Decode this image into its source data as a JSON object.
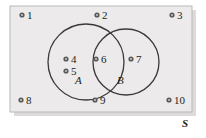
{
  "diagram": {
    "type": "venn-two-set",
    "universe_label": "S",
    "universe_rect": {
      "x": 10,
      "y": 6,
      "width": 182,
      "height": 106,
      "fill": "#eceaea",
      "stroke": "#bdbdbd"
    },
    "shadow_color": "#d8d6d6",
    "stroke_color": "#3a3a3a",
    "dot_color": "#5a5a5a",
    "text_color": "#231f20",
    "sets": [
      {
        "name": "A",
        "label": "A",
        "label_x": 75,
        "label_y": 75,
        "cx": 86,
        "cy": 62,
        "r": 38
      },
      {
        "name": "B",
        "label": "B",
        "label_x": 117,
        "label_y": 75,
        "cx": 126,
        "cy": 62,
        "r": 33
      }
    ],
    "elements": [
      {
        "label": "1",
        "dot_x": 22,
        "dot_y": 15,
        "text_x": 27,
        "text_y": 10,
        "region": "outside"
      },
      {
        "label": "2",
        "dot_x": 97,
        "dot_y": 15,
        "text_x": 102,
        "text_y": 10,
        "region": "outside"
      },
      {
        "label": "3",
        "dot_x": 172,
        "dot_y": 15,
        "text_x": 177,
        "text_y": 10,
        "region": "outside"
      },
      {
        "label": "4",
        "dot_x": 66,
        "dot_y": 59,
        "text_x": 71,
        "text_y": 54,
        "region": "A-only"
      },
      {
        "label": "5",
        "dot_x": 66,
        "dot_y": 71,
        "text_x": 71,
        "text_y": 66,
        "region": "A-only"
      },
      {
        "label": "6",
        "dot_x": 96,
        "dot_y": 59,
        "text_x": 101,
        "text_y": 54,
        "region": "A-and-B"
      },
      {
        "label": "7",
        "dot_x": 131,
        "dot_y": 59,
        "text_x": 136,
        "text_y": 54,
        "region": "B-only"
      },
      {
        "label": "8",
        "dot_x": 21,
        "dot_y": 100,
        "text_x": 26,
        "text_y": 95,
        "region": "outside"
      },
      {
        "label": "9",
        "dot_x": 95,
        "dot_y": 100,
        "text_x": 100,
        "text_y": 95,
        "region": "outside"
      },
      {
        "label": "10",
        "dot_x": 169,
        "dot_y": 100,
        "text_x": 174,
        "text_y": 95,
        "region": "outside"
      }
    ],
    "universe_label_x": 182,
    "universe_label_y": 118
  }
}
